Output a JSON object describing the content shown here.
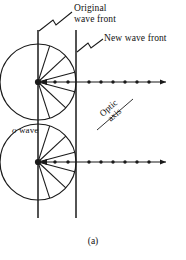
{
  "figure": {
    "caption": "(a)",
    "labels": {
      "original_wave_front_line1": "Original",
      "original_wave_front_line2": "wave front",
      "new_wave_front": "New wave front",
      "o_wave_italic": "o",
      "o_wave_rest": " wave",
      "optic_line1": "Optic",
      "optic_line2": "axis"
    },
    "colors": {
      "ink": "#1a1a1a",
      "background": "#ffffff"
    },
    "geometry": {
      "original_front_x": 38,
      "new_front_x": 76,
      "wavelet_radius": 38,
      "source_points_y": [
        82,
        162
      ],
      "line_top_y": 30,
      "line_bottom_y": 218,
      "spoke_angles_deg": [
        -72,
        -43,
        -15,
        0,
        15,
        43,
        72
      ],
      "axis_ray_end_x": 168,
      "axis_dot_count_inside": 3,
      "axis_dot_count_outside": 6
    }
  }
}
